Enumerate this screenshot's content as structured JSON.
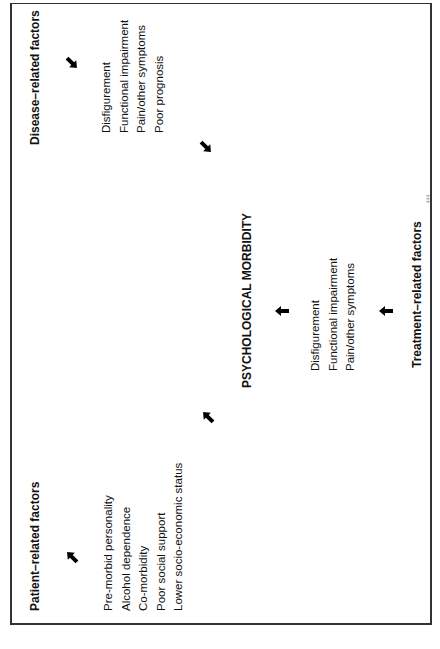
{
  "diagram": {
    "patient_factors": {
      "title": "Patient–related factors",
      "items": [
        "Pre-morbid personality",
        "Alcohol dependence",
        "Co-morbidity",
        "Poor social support",
        "Lower socio-economic status"
      ]
    },
    "disease_factors": {
      "title": "Disease–related factors",
      "items": [
        "Disfigurement",
        "Functional impairment",
        "Pain/other symptoms",
        "Poor prognosis"
      ]
    },
    "center": {
      "title": "PSYCHOLOGICAL MORBIDITY"
    },
    "treatment_factors": {
      "title": "Treatment–related factors",
      "items": [
        "Disfigurement",
        "Functional impairment",
        "Pain/other symptoms"
      ]
    },
    "arrows": [
      {
        "from": "patient-title",
        "to": "patient-list",
        "direction": "down-right"
      },
      {
        "from": "patient-list",
        "to": "psychological-morbidity",
        "direction": "up-right"
      },
      {
        "from": "disease-title",
        "to": "disease-list",
        "direction": "down-left"
      },
      {
        "from": "disease-list",
        "to": "psychological-morbidity",
        "direction": "down-left"
      },
      {
        "from": "treatment-list",
        "to": "psychological-morbidity",
        "direction": "up"
      },
      {
        "from": "treatment-title",
        "to": "treatment-list",
        "direction": "up"
      }
    ],
    "page_number": "444"
  }
}
